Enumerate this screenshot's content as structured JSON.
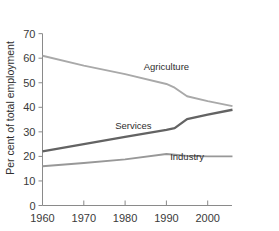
{
  "chart_data": {
    "type": "line",
    "title": "",
    "subtitle": "",
    "xlabel": "",
    "ylabel": "Per cent of total employment",
    "xlim": [
      1960,
      2006
    ],
    "ylim": [
      0,
      70
    ],
    "grid": false,
    "legend": "inline-labels",
    "x_ticks": [
      "1960",
      "1970",
      "1980",
      "1990",
      "2000"
    ],
    "x_tick_values": [
      1960,
      1970,
      1980,
      1990,
      2000
    ],
    "y_ticks": [
      "0",
      "10",
      "20",
      "30",
      "40",
      "50",
      "60",
      "70"
    ],
    "y_tick_values": [
      0,
      10,
      20,
      30,
      40,
      50,
      60,
      70
    ],
    "series": [
      {
        "name": "Agriculture",
        "color": "#a9a9a9",
        "width": 1.9,
        "label_x": 1990,
        "label_y": 55,
        "x": [
          1960,
          1970,
          1980,
          1990,
          1992,
          1995,
          2000,
          2006
        ],
        "values": [
          61,
          57,
          53.5,
          49.5,
          48,
          44.5,
          42.5,
          40.5
        ]
      },
      {
        "name": "Services",
        "color": "#636363",
        "width": 2.3,
        "label_x": 1982,
        "label_y": 31,
        "x": [
          1960,
          1970,
          1980,
          1990,
          1992,
          1995,
          2000,
          2006
        ],
        "values": [
          22,
          25,
          28,
          30.8,
          31.5,
          35.2,
          37,
          39
        ]
      },
      {
        "name": "Industry",
        "color": "#989898",
        "width": 1.9,
        "label_x": 1995,
        "label_y": 18.5,
        "x": [
          1960,
          1970,
          1980,
          1990,
          1992,
          1995,
          2000,
          2006
        ],
        "values": [
          16,
          17.3,
          18.8,
          21,
          20.7,
          20.2,
          20,
          20
        ]
      }
    ]
  }
}
